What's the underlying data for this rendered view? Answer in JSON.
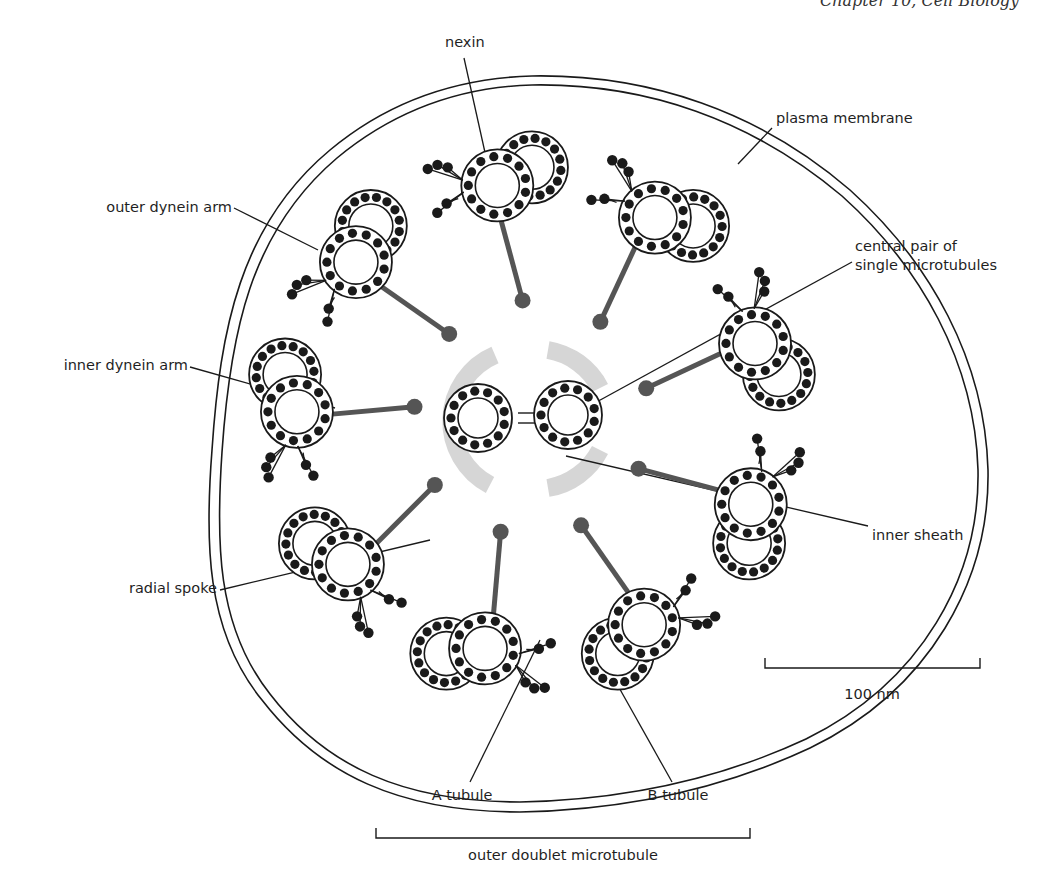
{
  "figure": {
    "header_fragment": "Chapter 10, Cell Biology",
    "labels": {
      "nexin": "nexin",
      "plasma_membrane": "plasma membrane",
      "outer_dynein_arm": "outer dynein arm",
      "central_pair_line1": "central pair of",
      "central_pair_line2": "single microtubules",
      "inner_dynein_arm": "inner dynein arm",
      "inner_sheath": "inner sheath",
      "radial_spoke": "radial spoke",
      "a_tubule": "A tubule",
      "b_tubule": "B tubule",
      "outer_doublet": "outer doublet microtubule"
    },
    "scale_bar": {
      "label": "100 nm"
    },
    "structure": {
      "center": [
        532,
        418
      ],
      "outer_doublet_count": 9,
      "central_singlet_count": 2,
      "protofilaments_per_tubule": 13
    },
    "colors": {
      "ink": "#1a1a1a",
      "spoke_gray": "#555555",
      "sheath_gray": "#d4d4d4",
      "background": "#ffffff"
    }
  }
}
